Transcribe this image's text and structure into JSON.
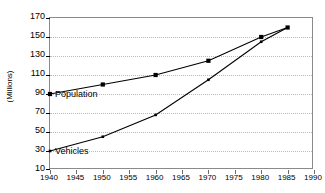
{
  "chart_data": {
    "type": "line",
    "title": "",
    "xlabel": "",
    "ylabel": "(Millions)",
    "xlim": [
      1940,
      1990
    ],
    "ylim": [
      10,
      170
    ],
    "xticks": [
      1940,
      1945,
      1950,
      1955,
      1960,
      1965,
      1970,
      1975,
      1980,
      1985,
      1990
    ],
    "yticks": [
      10,
      30,
      50,
      70,
      90,
      110,
      130,
      150,
      170
    ],
    "grid": true,
    "legend": "inline-labels",
    "x": [
      1940,
      1950,
      1960,
      1970,
      1980,
      1985
    ],
    "series": [
      {
        "name": "Population",
        "label": "Population",
        "color": "#000000",
        "marker": "square",
        "values": [
          90,
          100,
          110,
          125,
          150,
          160
        ]
      },
      {
        "name": "Vehicles",
        "label": "Vehicles",
        "color": "#000000",
        "marker": "small-square",
        "values": [
          30,
          45,
          68,
          105,
          145,
          160
        ]
      }
    ],
    "annotations": [
      {
        "text": "Population",
        "x": 1940,
        "y": 90
      },
      {
        "text": "Vehicles",
        "x": 1940,
        "y": 30
      }
    ]
  },
  "axis": {
    "y_title": "(Millions)",
    "y_labels": [
      "170",
      "150",
      "130",
      "110",
      "90",
      "70",
      "50",
      "30",
      "10"
    ],
    "x_labels": [
      "1940",
      "1945",
      "1950",
      "1955",
      "1960",
      "1965",
      "1970",
      "1975",
      "1980",
      "1985",
      "1990"
    ]
  },
  "labels": {
    "population": "Population",
    "vehicles": "Vehicles"
  }
}
